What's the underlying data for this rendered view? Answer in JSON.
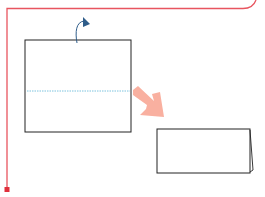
{
  "diagram": {
    "type": "origami-fold-instruction",
    "steps": [
      {
        "name": "square-paper",
        "fold_line": "horizontal-middle-valley",
        "action": "fold top edge backward"
      },
      {
        "name": "folded-rectangle",
        "result": "paper folded in half"
      }
    ],
    "colors": {
      "frame": "#e8555f",
      "paper_stroke": "#222222",
      "fold_line": "#5ab4d6",
      "fold_arrow": "#2f5d8a",
      "step_arrow": "#f9b0a0"
    }
  }
}
